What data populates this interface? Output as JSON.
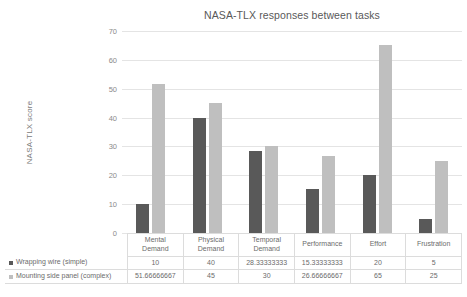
{
  "chart_data": {
    "type": "bar",
    "title": "NASA-TLX responses between tasks",
    "xlabel": "",
    "ylabel": "NASA-TLX score",
    "ylim": [
      0,
      70
    ],
    "ytick_step": 10,
    "yticks": [
      70,
      60,
      50,
      40,
      30,
      20,
      10,
      0
    ],
    "grid": true,
    "legend_position": "data-table-left",
    "categories": [
      "Mental Demand",
      "Physical Demand",
      "Temporal Demand",
      "Performance",
      "Effort",
      "Frustration"
    ],
    "category_lines": [
      [
        "Mental",
        "Demand"
      ],
      [
        "Physical",
        "Demand"
      ],
      [
        "Temporal",
        "Demand"
      ],
      [
        "Performance"
      ],
      [
        "Effort"
      ],
      [
        "Frustration"
      ]
    ],
    "series": [
      {
        "name": "Wrapping wire (simple)",
        "color": "#595959",
        "values": [
          10,
          40,
          28.33333333,
          15.33333333,
          20,
          5
        ],
        "labels": [
          "10",
          "40",
          "28.33333333",
          "15.33333333",
          "20",
          "5"
        ]
      },
      {
        "name": "Mounting side panel (complex)",
        "color": "#bfbfbf",
        "values": [
          51.66666667,
          45,
          30,
          26.66666667,
          65,
          25
        ],
        "labels": [
          "51.66666667",
          "45",
          "30",
          "26.66666667",
          "65",
          "25"
        ]
      }
    ]
  }
}
